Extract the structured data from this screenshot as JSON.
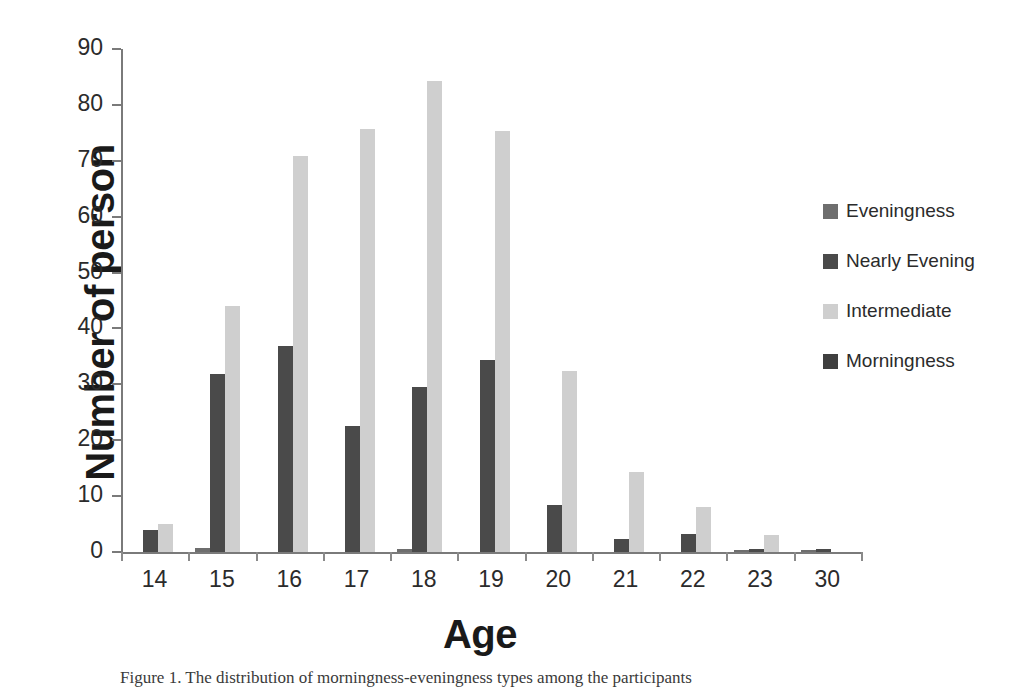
{
  "chart_data": {
    "type": "bar",
    "title": "",
    "xlabel": "Age",
    "ylabel": "Number of person",
    "categories": [
      "14",
      "15",
      "16",
      "17",
      "18",
      "19",
      "20",
      "21",
      "22",
      "23",
      "30"
    ],
    "ylim": [
      0,
      90
    ],
    "yticks": [
      0,
      10,
      20,
      30,
      40,
      50,
      60,
      70,
      80,
      90
    ],
    "grid": false,
    "legend_position": "right",
    "series": [
      {
        "name": "Eveningness",
        "color": "#6e6e6e",
        "values": [
          0,
          0.8,
          0,
          0,
          0.6,
          0,
          0,
          0,
          0,
          0.3,
          0.3
        ]
      },
      {
        "name": "Nearly Evening",
        "color": "#4a4a4a",
        "values": [
          4,
          31.8,
          36.8,
          22.6,
          29.5,
          34.3,
          8.4,
          2.3,
          3.2,
          0.5,
          0.6
        ]
      },
      {
        "name": "Intermediate",
        "color": "#cfcfcf",
        "values": [
          5,
          44,
          70.8,
          75.6,
          84.3,
          75.3,
          32.3,
          14.3,
          8,
          3,
          0
        ]
      },
      {
        "name": "Morningness",
        "color": "#3f3f3f",
        "values": [
          0,
          0,
          0,
          0,
          0,
          0,
          0,
          0,
          0,
          0,
          0
        ]
      }
    ]
  },
  "legend": {
    "items": [
      {
        "label": "Eveningness",
        "color": "#6e6e6e"
      },
      {
        "label": "Nearly Evening",
        "color": "#4a4a4a"
      },
      {
        "label": "Intermediate",
        "color": "#cfcfcf"
      },
      {
        "label": "Morningness",
        "color": "#3f3f3f"
      }
    ]
  },
  "caption": {
    "text": "Figure 1.   The distribution of morningness-eveningness types among the participants"
  },
  "axes": {
    "y_title": "Number of person",
    "x_title": "Age"
  }
}
